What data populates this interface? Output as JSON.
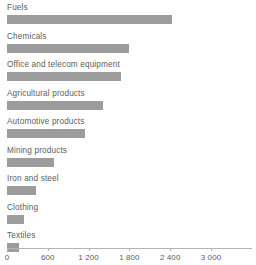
{
  "chart_data": {
    "type": "bar",
    "orientation": "horizontal",
    "title": "",
    "subtitle": "",
    "xlabel": "",
    "ylabel": "",
    "categories": [
      "Fuels",
      "Chemicals",
      "Office and telecom equipment",
      "Agricultural products",
      "Automotive products",
      "Mining products",
      "Iron and steel",
      "Clothing",
      "Textiles"
    ],
    "values": [
      2430,
      1790,
      1680,
      1410,
      1150,
      690,
      430,
      250,
      175
    ],
    "xlim": [
      0,
      3000
    ],
    "ylim": null,
    "grid": false,
    "legend": null,
    "legend_position": "none",
    "tick_values": [
      0,
      600,
      1200,
      1800,
      2400,
      3000
    ],
    "tick_labels": [
      "0",
      "600",
      "1 200",
      "1 800",
      "2 400",
      "3 000"
    ],
    "annotations": [],
    "colors": {
      "bar": "#9c9c9c",
      "label_text": "#5d5d5d",
      "tick_text": "#5d5d5d",
      "axis_line": "#b4b4b4",
      "background": "#ffffff"
    }
  }
}
